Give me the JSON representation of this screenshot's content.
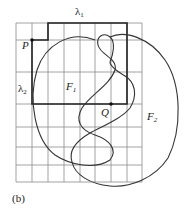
{
  "figure": {
    "caption": "(b)",
    "grid": {
      "x_lines": [
        16,
        32,
        48,
        64,
        80,
        95,
        111,
        127,
        142
      ],
      "y_lines": [
        23,
        40,
        72,
        104,
        127,
        147,
        165,
        182
      ]
    },
    "labels": {
      "lambda1": {
        "text": "λ",
        "sub": "1"
      },
      "lambda2": {
        "text": "λ",
        "sub": "2"
      },
      "P": "P",
      "Q": "Q",
      "F1": {
        "text": "F",
        "sub": "1"
      },
      "F2": {
        "text": "F",
        "sub": "2"
      }
    },
    "points": {
      "P": [
        32,
        40
      ],
      "Q": [
        111,
        104
      ]
    },
    "colors": {
      "grid": "#8a8a8a",
      "path": "#222222",
      "curve": "#333333",
      "background": "#ffffff"
    }
  }
}
